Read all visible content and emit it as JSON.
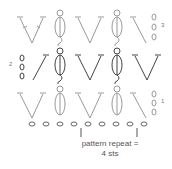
{
  "diagram": {
    "type": "crochet-chart",
    "rows": [
      {
        "number": "3",
        "turning_chain": 3,
        "stitches": [
          "V-st",
          "bobble",
          "V-st",
          "bobble",
          "dc"
        ],
        "color": "#999999"
      },
      {
        "number": "2",
        "turning_chain": 3,
        "stitches": [
          "dc",
          "bobble",
          "V-st",
          "bobble",
          "V-st"
        ],
        "color": "#444444"
      },
      {
        "number": "1",
        "turning_chain": 3,
        "stitches": [
          "V-st",
          "bobble",
          "V-st",
          "bobble",
          "dc"
        ],
        "color": "#999999"
      }
    ],
    "foundation_chain": 10,
    "repeat_label_line1": "pattern repeat =",
    "repeat_label_line2": "4 sts"
  }
}
